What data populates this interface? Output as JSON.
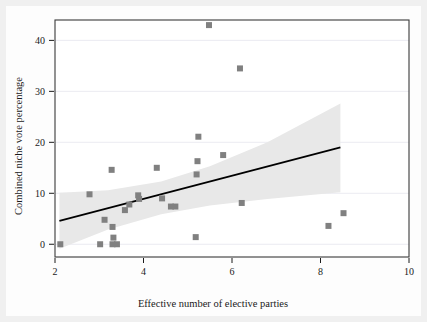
{
  "figure": {
    "background_color": "#f0f0f0",
    "panel_color": "#ffffff",
    "frame_color": "#3a3a3a"
  },
  "chart_data": {
    "type": "scatter",
    "title": "",
    "xlabel": "Effective number of elective parties",
    "ylabel": "Combined niche vote percentage",
    "xlim": [
      2,
      10
    ],
    "ylim": [
      -2.5,
      44
    ],
    "xticks": [
      2,
      4,
      6,
      8,
      10
    ],
    "yticks": [
      0,
      10,
      20,
      30,
      40
    ],
    "xtick_labels": [
      "2",
      "4",
      "6",
      "8",
      "10"
    ],
    "ytick_labels": [
      "0",
      "10",
      "20",
      "30",
      "40"
    ],
    "grid": "horizontal-light",
    "legend": "none",
    "marker": {
      "shape": "square",
      "color": "#808080",
      "size_px": 6
    },
    "points": [
      {
        "x": 2.12,
        "y": 0.0
      },
      {
        "x": 2.78,
        "y": 9.8
      },
      {
        "x": 3.02,
        "y": 0.0
      },
      {
        "x": 3.12,
        "y": 4.8
      },
      {
        "x": 3.28,
        "y": 14.6
      },
      {
        "x": 3.3,
        "y": 3.4
      },
      {
        "x": 3.32,
        "y": 1.3
      },
      {
        "x": 3.3,
        "y": 0.0
      },
      {
        "x": 3.4,
        "y": 0.0
      },
      {
        "x": 3.58,
        "y": 6.7
      },
      {
        "x": 3.68,
        "y": 7.8
      },
      {
        "x": 3.88,
        "y": 9.6
      },
      {
        "x": 3.9,
        "y": 8.9
      },
      {
        "x": 4.3,
        "y": 15.0
      },
      {
        "x": 4.42,
        "y": 9.0
      },
      {
        "x": 4.62,
        "y": 7.4
      },
      {
        "x": 4.72,
        "y": 7.4
      },
      {
        "x": 5.18,
        "y": 1.4
      },
      {
        "x": 5.2,
        "y": 13.7
      },
      {
        "x": 5.22,
        "y": 16.3
      },
      {
        "x": 5.24,
        "y": 21.1
      },
      {
        "x": 5.48,
        "y": 43.0
      },
      {
        "x": 5.8,
        "y": 17.5
      },
      {
        "x": 6.18,
        "y": 34.5
      },
      {
        "x": 6.22,
        "y": 8.1
      },
      {
        "x": 8.18,
        "y": 3.6
      },
      {
        "x": 8.52,
        "y": 6.1
      }
    ],
    "fit_line": {
      "label": "linear fit",
      "color": "#000000",
      "x_start": 2.1,
      "y_start": 4.6,
      "x_end": 8.45,
      "y_end": 19.0
    },
    "confidence_band": {
      "label": "confidence interval",
      "color": "#e8e8e8",
      "upper": [
        {
          "x": 2.1,
          "y": 10.1
        },
        {
          "x": 3.2,
          "y": 10.6
        },
        {
          "x": 4.4,
          "y": 12.3
        },
        {
          "x": 5.5,
          "y": 15.3
        },
        {
          "x": 6.8,
          "y": 20.0
        },
        {
          "x": 8.45,
          "y": 27.6
        }
      ],
      "lower": [
        {
          "x": 2.1,
          "y": -0.9
        },
        {
          "x": 3.2,
          "y": 2.9
        },
        {
          "x": 4.4,
          "y": 5.9
        },
        {
          "x": 5.5,
          "y": 7.6
        },
        {
          "x": 6.8,
          "y": 8.9
        },
        {
          "x": 8.45,
          "y": 10.2
        }
      ]
    }
  }
}
